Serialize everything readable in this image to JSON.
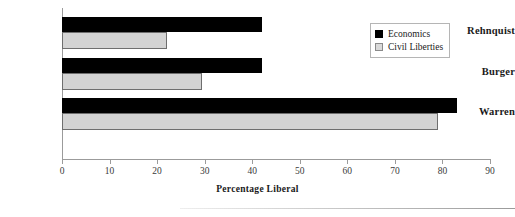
{
  "chart_data": {
    "type": "bar",
    "orientation": "horizontal",
    "title": "",
    "xlabel": "Percentage Liberal",
    "ylabel": "",
    "categories": [
      "Rehnquist",
      "Burger",
      "Warren"
    ],
    "series": [
      {
        "name": "Economics",
        "color": "#000000",
        "values": [
          42,
          42,
          83
        ]
      },
      {
        "name": "Civil Liberties",
        "color": "#d3d3d3",
        "values": [
          22,
          29.5,
          79
        ]
      }
    ],
    "xlim": [
      0,
      90
    ],
    "xticks": [
      0,
      10,
      20,
      30,
      40,
      50,
      60,
      70,
      80,
      90
    ],
    "xtick_labels": [
      "0",
      "10",
      "20",
      "30",
      "40",
      "50",
      "60",
      "70",
      "80",
      "90"
    ],
    "grid": false,
    "legend_position": "top-right",
    "legend_entries": [
      "Economics",
      "Civil Liberties"
    ]
  },
  "legend": {
    "economics_label": "Economics",
    "civil_label": "Civil Liberties"
  },
  "axis": {
    "title": "Percentage Liberal"
  }
}
